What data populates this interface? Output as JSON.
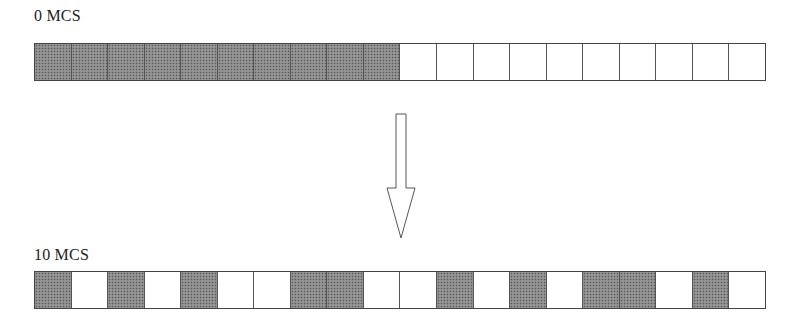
{
  "diagram": {
    "top": {
      "label": "0 MCS",
      "cells": [
        1,
        1,
        1,
        1,
        1,
        1,
        1,
        1,
        1,
        1,
        0,
        0,
        0,
        0,
        0,
        0,
        0,
        0,
        0,
        0
      ]
    },
    "bottom": {
      "label": "10 MCS",
      "cells": [
        1,
        0,
        1,
        0,
        1,
        0,
        0,
        1,
        1,
        0,
        0,
        1,
        0,
        1,
        0,
        1,
        1,
        0,
        1,
        0
      ]
    },
    "arrow": "down-arrow",
    "colors": {
      "filled": "#8a8a8a",
      "empty": "#ffffff",
      "border": "#444444"
    }
  }
}
